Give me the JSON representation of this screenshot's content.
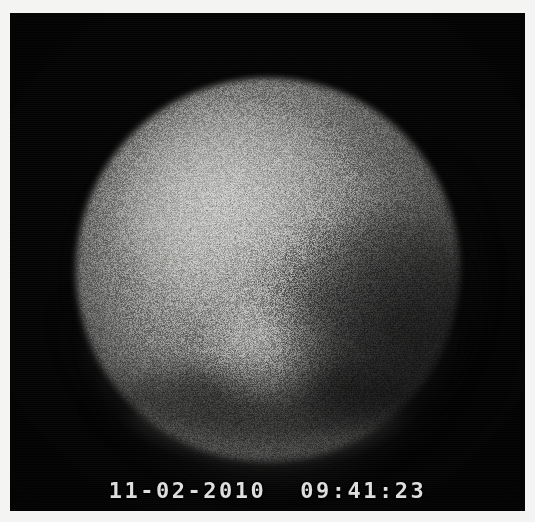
{
  "capture": {
    "frame_kind": "monochrome-camera-frame",
    "background_color": "#050505",
    "page_background_color": "#f4f4f2"
  },
  "subject": {
    "name": "luminous-disc",
    "description": "bright circular disc on black background",
    "center_x": 268,
    "center_y": 270,
    "radius": 192,
    "peak_gray": "#989896",
    "rim_gray": "#161616"
  },
  "osd": {
    "date": "11-02-2010",
    "time": "09:41:23",
    "color": "#dedede"
  }
}
